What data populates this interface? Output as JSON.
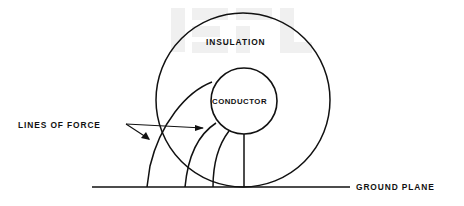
{
  "figure": {
    "type": "technical-line-diagram",
    "background_color": "#ffffff",
    "line_color": "#111111",
    "watermark_color": "#f0f0f0"
  },
  "labels": {
    "insulation": "INSULATION",
    "conductor": "CONDUCTOR",
    "lines_of_force": "LINES OF FORCE",
    "ground_plane": "GROUND PLANE"
  },
  "geometry": {
    "insulation_circle": {
      "cx": 243,
      "cy": 100,
      "r": 87
    },
    "conductor_circle": {
      "cx": 244,
      "cy": 101,
      "r": 33
    },
    "ground_plane_line": {
      "x1": 92,
      "y1": 187,
      "x2": 350,
      "y2": 187
    },
    "vertical_field_line": {
      "x": 244,
      "y1": 134,
      "y2": 187
    },
    "field_line_ground_contacts": [
      147,
      185,
      213,
      244
    ],
    "field_line_count": 4
  },
  "label_positions": {
    "insulation": {
      "x": 206,
      "y": 45
    },
    "conductor": {
      "x": 212,
      "y": 104
    },
    "lines_of_force": {
      "x": 18,
      "y": 128
    },
    "ground_plane": {
      "x": 356,
      "y": 189
    }
  },
  "leader": {
    "origin": {
      "x": 126,
      "y": 124
    },
    "arrow_lower_tip": {
      "x": 147,
      "y": 141
    },
    "arrow_right_tip": {
      "x": 202,
      "y": 128
    }
  }
}
